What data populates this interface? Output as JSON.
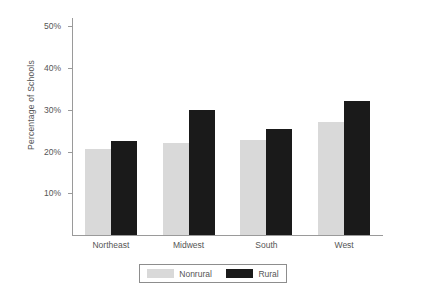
{
  "chart_data": {
    "type": "bar",
    "title": "",
    "xlabel": "",
    "ylabel": "Percentage of Schools",
    "categories": [
      "Northeast",
      "Midwest",
      "South",
      "West"
    ],
    "series": [
      {
        "name": "Nonrural",
        "color": "#d9d9d9",
        "values": [
          20.5,
          22.0,
          22.8,
          27.0
        ]
      },
      {
        "name": "Rural",
        "color": "#1a1a1a",
        "values": [
          22.5,
          30.0,
          25.3,
          32.0
        ]
      }
    ],
    "ylim": [
      0,
      52
    ],
    "yticks": [
      10,
      20,
      30,
      40,
      50
    ],
    "ytick_labels": [
      "10%",
      "20%",
      "30%",
      "40%",
      "50%"
    ],
    "grid": false,
    "legend_position": "bottom"
  },
  "legend": {
    "items": [
      {
        "label": "Nonrural",
        "color": "#d9d9d9"
      },
      {
        "label": "Rural",
        "color": "#1a1a1a"
      }
    ]
  }
}
